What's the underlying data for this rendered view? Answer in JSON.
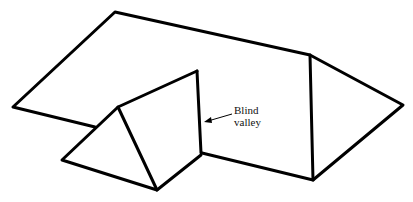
{
  "diagram": {
    "type": "roof-line-drawing",
    "annotation": {
      "line1": "Blind",
      "line2": "valley"
    },
    "colors": {
      "stroke": "#000000",
      "background": "#ffffff"
    }
  }
}
